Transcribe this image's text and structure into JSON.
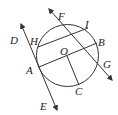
{
  "figure": {
    "type": "circle-geometry",
    "circle": {
      "center": "O",
      "cx": 67.5,
      "cy": 55.5,
      "r": 31
    },
    "points": {
      "O": {
        "x": 67,
        "y": 56
      },
      "A": {
        "x": 39,
        "y": 67
      },
      "B": {
        "x": 97,
        "y": 43
      },
      "H": {
        "x": 38,
        "y": 47
      },
      "I": {
        "x": 88,
        "y": 28
      },
      "C": {
        "x": 79,
        "y": 85
      }
    },
    "lines": [
      {
        "name": "DE",
        "from": "D",
        "to": "E",
        "tangent_at": "A"
      },
      {
        "name": "FG",
        "from": "F",
        "to": "G"
      }
    ],
    "segments": [
      "AB",
      "HI",
      "OC"
    ],
    "labels": {
      "D": "D",
      "H": "H",
      "F": "F",
      "I": "I",
      "B": "B",
      "O": "O",
      "G": "G",
      "A": "A",
      "C": "C",
      "E": "E"
    },
    "stroke_color": "#333333"
  }
}
